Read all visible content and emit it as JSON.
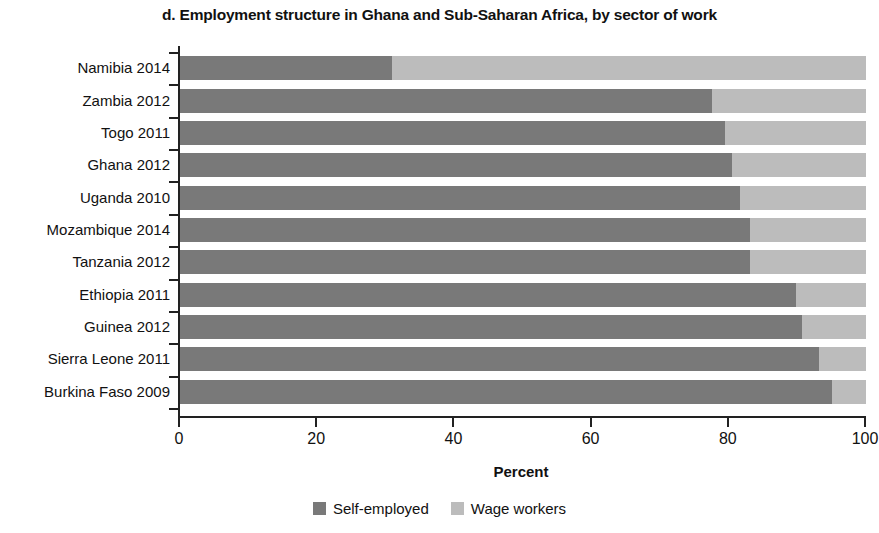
{
  "chart_data": {
    "type": "bar",
    "subtype": "stacked-horizontal-100",
    "title": "d. Employment structure in Ghana and Sub-Saharan Africa, by sector of work",
    "xlabel": "Percent",
    "ylabel": "",
    "xlim": [
      0,
      100
    ],
    "xticks": [
      0,
      20,
      40,
      60,
      80,
      100
    ],
    "xtick_labels": [
      "0",
      "20",
      "40",
      "60",
      "80",
      "100"
    ],
    "grid": false,
    "legend_position": "bottom",
    "categories": [
      "Namibia 2014",
      "Zambia 2012",
      "Togo 2011",
      "Ghana 2012",
      "Uganda 2010",
      "Mozambique 2014",
      "Tanzania 2012",
      "Ethiopia 2011",
      "Guinea 2012",
      "Sierra Leone 2011",
      "Burkina Faso 2009"
    ],
    "series": [
      {
        "name": "Self-employed",
        "color": "#797979",
        "values": [
          30.9,
          77.6,
          79.4,
          80.5,
          81.6,
          83.1,
          83.1,
          89.8,
          90.7,
          93.1,
          95.0
        ]
      },
      {
        "name": "Wage workers",
        "color": "#bcbcbc",
        "values": [
          69.1,
          22.4,
          20.6,
          19.5,
          18.4,
          16.9,
          16.9,
          10.2,
          9.3,
          6.9,
          5.0
        ]
      }
    ]
  },
  "legend": {
    "items": [
      {
        "label": "Self-employed",
        "color": "#797979"
      },
      {
        "label": "Wage workers",
        "color": "#bcbcbc"
      }
    ]
  }
}
